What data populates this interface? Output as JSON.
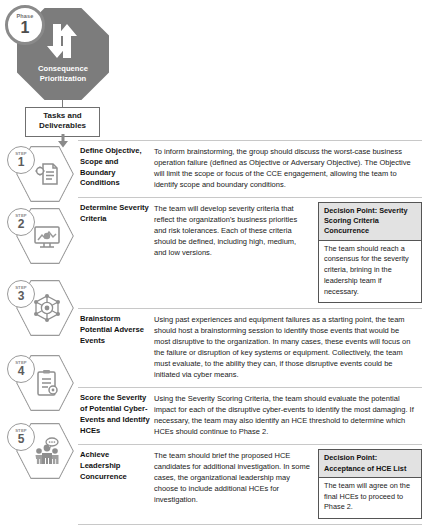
{
  "phase": {
    "badge_word": "Phase",
    "badge_number": "1",
    "title": "Consequence\nPrioritization",
    "title_line1": "Consequence",
    "title_line2": "Prioritization",
    "tasks_box_line1": "Tasks and",
    "tasks_box_line2": "Deliverables",
    "shape_color": "#7c7c7c",
    "arrow_down_icon": "arrow-down-icon",
    "arrow_up_icon": "arrow-up-icon",
    "flow_arrow_icon": "flow-arrow-down-icon"
  },
  "table": {
    "step_word": "STEP",
    "rows": [
      {
        "step": "1",
        "icon": "document-gear-icon",
        "title": "Define Objective, Scope and Boundary Conditions",
        "description": "To inform brainstorming, the group should discuss the worst-case business operation failure (defined as Objective or Adversary Objective). The Objective will limit the scope or focus of the CCE engagement, allowing the team to identify scope and boundary conditions.",
        "decision": null
      },
      {
        "step": "2",
        "icon": "monitor-gear-icon",
        "title": "Determine Severity Criteria",
        "description": "The team will develop severity criteria that reflect the organization's business priorities and risk tolerances. Each of these criteria should be defined, including high, medium, and low versions.",
        "decision": {
          "heading": "Decision Point: Severity Scoring Criteria Concurrence",
          "body": "The team should reach a consensus for the severity criteria, brining in the leadership team if necessary."
        }
      },
      {
        "step": "3",
        "icon": "network-gear-icon",
        "title": "Brainstorm Potential Adverse Events",
        "description": "Using past experiences and equipment failures as a starting point, the team should host a brainstorming session to identify those events that would be most disruptive to the organization. In many cases, these events will focus on the failure or disruption of key systems or equipment. Collectively, the team must evaluate, to the ability they can, if those disruptive events could be initiated via cyber means.",
        "decision": null
      },
      {
        "step": "4",
        "icon": "clipboard-gear-icon",
        "title": "Score the Severity of Potential Cyber-Events and Identify HCEs",
        "description": "Using the Severity Scoring Criteria, the team should evaluate the potential impact for each of the disruptive cyber-events to identify the most damaging. If necessary, the team may also identify an HCE threshold to determine which HCEs should continue to Phase 2.",
        "decision": null
      },
      {
        "step": "5",
        "icon": "people-discussion-icon",
        "title": "Achieve Leadership Concurrence",
        "description": "The team should brief the proposed HCE candidates for additional investigation. In some cases, the organizational leadership may choose to include additional HCEs for investigation.",
        "decision": {
          "heading": "Decision Point: Acceptance of HCE List",
          "body": "The team will agree on the final HCEs to proceed to Phase 2."
        }
      }
    ]
  },
  "colors": {
    "octagon_gray": "#7c7c7c",
    "hexagon_outline": "#9a9a9a",
    "decision_header_fill": "#e2e2e2",
    "rule_gray": "#c8c8c8",
    "text": "#1a1a1a"
  }
}
